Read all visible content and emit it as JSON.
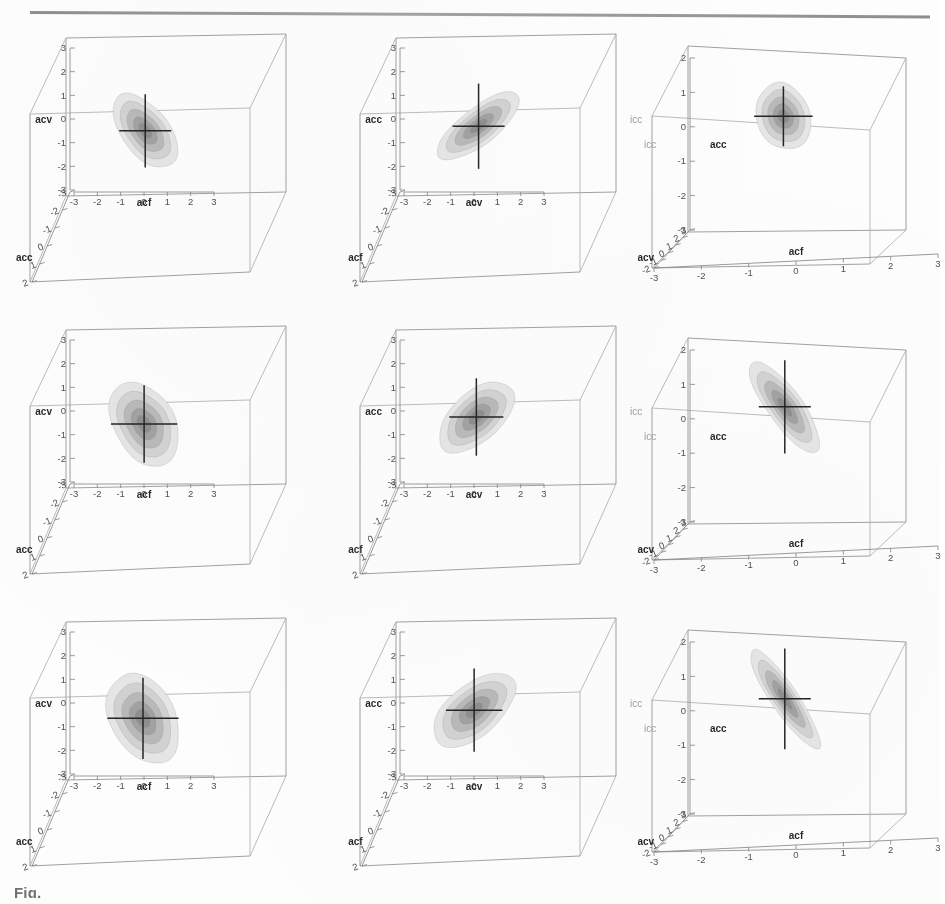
{
  "page": {
    "kind": "scanned-journal-figure",
    "caption_fragment": "Fig.",
    "has_top_rule": true
  },
  "variables": {
    "acf": "acf",
    "acv": "acv",
    "acc": "acc",
    "ghost_label": "icc"
  },
  "contour_palette": {
    "band1": "#e4e4e4",
    "band2": "#cfcfcf",
    "band3": "#b4b4b4",
    "band4": "#9a9a9a",
    "band5": "#858585",
    "crosshair": "#1d1d1d",
    "box": "#8d8d8d"
  },
  "chart_data": {
    "type": "contour",
    "title": "",
    "subtitle": "",
    "grid_rows": 3,
    "grid_cols": 3,
    "contour_levels": [
      0.2,
      0.4,
      0.6,
      0.8
    ],
    "n_bands": 4,
    "panels": [
      {
        "id": "r1c1",
        "row": 1,
        "col": 1,
        "xlabel": "acf",
        "ylabel": "acv",
        "zlabel": "acc",
        "xticks": [
          -3,
          -2,
          -1,
          0,
          1,
          2,
          3
        ],
        "yticks": [
          3,
          2,
          1,
          0,
          -1,
          -2,
          -3
        ],
        "zticks": [
          -3,
          -2,
          -1,
          0,
          1,
          2
        ],
        "xlim": [
          -3,
          3
        ],
        "ylim": [
          -3,
          3
        ],
        "zlim": [
          -3,
          2
        ],
        "ghost_label": "",
        "center": [
          0.1,
          -0.55
        ],
        "orientation_deg": -38,
        "rx": 1.05,
        "ry": 1.85,
        "correlation": 0.62
      },
      {
        "id": "r1c2",
        "row": 1,
        "col": 2,
        "xlabel": "acv",
        "ylabel": "acc",
        "zlabel": "acf",
        "xticks": [
          -3,
          -2,
          -1,
          0,
          1,
          2,
          3
        ],
        "yticks": [
          3,
          2,
          1,
          0,
          -1,
          -2,
          -3
        ],
        "zticks": [
          -3,
          -2,
          -1,
          0,
          1,
          2
        ],
        "xlim": [
          -3,
          3
        ],
        "ylim": [
          -3,
          3
        ],
        "zlim": [
          -3,
          2
        ],
        "ghost_label": "icc",
        "center": [
          0.25,
          -0.35
        ],
        "orientation_deg": 52,
        "rx": 0.82,
        "ry": 2.15,
        "correlation": -0.72
      },
      {
        "id": "r1c3",
        "row": 1,
        "col": 3,
        "xlabel": "acf",
        "ylabel": "acc",
        "zlabel": "acv",
        "xticks": [
          -3,
          -2,
          -1,
          0,
          1,
          2,
          3
        ],
        "yticks": [
          2,
          1,
          0,
          -1,
          -2,
          -3
        ],
        "zticks": [
          3,
          2,
          1,
          0,
          -1,
          -2
        ],
        "xlim": [
          -3,
          3
        ],
        "ylim": [
          -3,
          2
        ],
        "zlim": [
          -2,
          3
        ],
        "ghost_label": "icc",
        "center": [
          -0.45,
          0.3
        ],
        "orientation_deg": -20,
        "rx": 0.95,
        "ry": 1.15,
        "correlation": 0.25
      },
      {
        "id": "r2c1",
        "row": 2,
        "col": 1,
        "xlabel": "acf",
        "ylabel": "acv",
        "zlabel": "acc",
        "xticks": [
          -3,
          -2,
          -1,
          0,
          1,
          2,
          3
        ],
        "yticks": [
          3,
          2,
          1,
          0,
          -1,
          -2,
          -3
        ],
        "zticks": [
          -3,
          -2,
          -1,
          0,
          1,
          2
        ],
        "xlim": [
          -3,
          3
        ],
        "ylim": [
          -3,
          3
        ],
        "zlim": [
          -3,
          2
        ],
        "ghost_label": "",
        "center": [
          0.05,
          -0.6
        ],
        "orientation_deg": -30,
        "rx": 1.35,
        "ry": 1.95,
        "correlation": 0.45
      },
      {
        "id": "r2c2",
        "row": 2,
        "col": 2,
        "xlabel": "acv",
        "ylabel": "acc",
        "zlabel": "acf",
        "xticks": [
          -3,
          -2,
          -1,
          0,
          1,
          2,
          3
        ],
        "yticks": [
          3,
          2,
          1,
          0,
          -1,
          -2,
          -3
        ],
        "zticks": [
          -3,
          -2,
          -1,
          0,
          1,
          2
        ],
        "xlim": [
          -3,
          3
        ],
        "ylim": [
          -3,
          3
        ],
        "zlim": [
          -3,
          2
        ],
        "ghost_label": "icc",
        "center": [
          0.15,
          -0.3
        ],
        "orientation_deg": 48,
        "rx": 1.1,
        "ry": 1.95,
        "correlation": -0.6
      },
      {
        "id": "r2c3",
        "row": 2,
        "col": 3,
        "xlabel": "acf",
        "ylabel": "acc",
        "zlabel": "acv",
        "xticks": [
          -3,
          -2,
          -1,
          0,
          1,
          2,
          3
        ],
        "yticks": [
          2,
          1,
          0,
          -1,
          -2,
          -3
        ],
        "zticks": [
          3,
          2,
          1,
          0,
          -1,
          -2
        ],
        "xlim": [
          -3,
          3
        ],
        "ylim": [
          -3,
          2
        ],
        "zlim": [
          -2,
          3
        ],
        "ghost_label": "icc",
        "center": [
          -0.4,
          0.35
        ],
        "orientation_deg": -36,
        "rx": 0.62,
        "ry": 1.85,
        "correlation": 0.86
      },
      {
        "id": "r3c1",
        "row": 3,
        "col": 1,
        "xlabel": "acf",
        "ylabel": "acv",
        "zlabel": "acc",
        "xticks": [
          -3,
          -2,
          -1,
          0,
          1,
          2,
          3
        ],
        "yticks": [
          3,
          2,
          1,
          0,
          -1,
          -2,
          -3
        ],
        "zticks": [
          -3,
          -2,
          -1,
          0,
          1,
          2
        ],
        "xlim": [
          -3,
          3
        ],
        "ylim": [
          -3,
          3
        ],
        "zlim": [
          -3,
          2
        ],
        "ghost_label": "",
        "center": [
          0.0,
          -0.7
        ],
        "orientation_deg": -28,
        "rx": 1.45,
        "ry": 2.05,
        "correlation": 0.4
      },
      {
        "id": "r3c2",
        "row": 3,
        "col": 2,
        "xlabel": "acv",
        "ylabel": "acc",
        "zlabel": "acf",
        "xticks": [
          -3,
          -2,
          -1,
          0,
          1,
          2,
          3
        ],
        "yticks": [
          3,
          2,
          1,
          0,
          -1,
          -2,
          -3
        ],
        "zticks": [
          -3,
          -2,
          -1,
          0,
          1,
          2
        ],
        "xlim": [
          -3,
          3
        ],
        "ylim": [
          -3,
          3
        ],
        "zlim": [
          -3,
          2
        ],
        "ghost_label": "icc",
        "center": [
          0.05,
          -0.35
        ],
        "orientation_deg": 50,
        "rx": 1.15,
        "ry": 2.1,
        "correlation": -0.58
      },
      {
        "id": "r3c3",
        "row": 3,
        "col": 3,
        "xlabel": "acf",
        "ylabel": "acc",
        "zlabel": "acv",
        "xticks": [
          -3,
          -2,
          -1,
          0,
          1,
          2,
          3
        ],
        "yticks": [
          2,
          1,
          0,
          -1,
          -2,
          -3
        ],
        "zticks": [
          3,
          2,
          1,
          0,
          -1,
          -2
        ],
        "xlim": [
          -3,
          3
        ],
        "ylim": [
          -3,
          2
        ],
        "zlim": [
          -2,
          3
        ],
        "ghost_label": "icc",
        "center": [
          -0.4,
          0.35
        ],
        "orientation_deg": -34,
        "rx": 0.48,
        "ry": 2.0,
        "correlation": 0.93
      }
    ]
  }
}
